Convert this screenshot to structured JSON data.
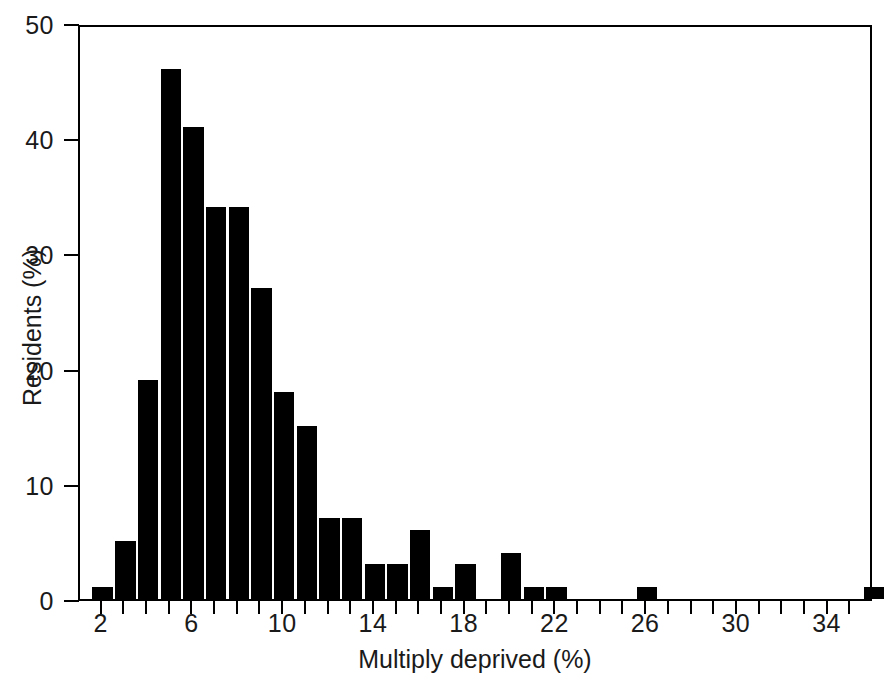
{
  "chart_data": {
    "type": "bar",
    "title": "",
    "subtitle": "",
    "xlabel": "Multiply deprived (%)",
    "ylabel": "Residents (%)",
    "xlim": [
      1,
      36
    ],
    "ylim": [
      0,
      50
    ],
    "grid": false,
    "legend": null,
    "bar_color": "#000000",
    "axis_color": "#000000",
    "bin_width": 1,
    "x_tick_labels": [
      "2",
      "6",
      "10",
      "14",
      "18",
      "22",
      "26",
      "30",
      "34"
    ],
    "x_tick_values": [
      2,
      6,
      10,
      14,
      18,
      22,
      26,
      30,
      34
    ],
    "x_minor_tick_values": [
      1,
      2,
      3,
      4,
      5,
      6,
      7,
      8,
      9,
      10,
      11,
      12,
      13,
      14,
      15,
      16,
      17,
      18,
      19,
      20,
      21,
      22,
      23,
      24,
      25,
      26,
      27,
      28,
      29,
      30,
      31,
      32,
      33,
      34,
      35,
      36
    ],
    "y_tick_labels": [
      "0",
      "10",
      "20",
      "30",
      "40",
      "50"
    ],
    "y_tick_values": [
      0,
      10,
      20,
      30,
      40,
      50
    ],
    "categories": [
      2,
      3,
      4,
      5,
      6,
      7,
      8,
      9,
      10,
      11,
      12,
      13,
      14,
      15,
      16,
      17,
      18,
      19,
      20,
      21,
      22,
      23,
      24,
      25,
      26,
      27,
      28,
      29,
      30,
      31,
      32,
      33,
      34,
      35,
      36
    ],
    "values": [
      1,
      5,
      19,
      46,
      41,
      34,
      34,
      27,
      18,
      15,
      7,
      7,
      3,
      3,
      6,
      1,
      3,
      0,
      4,
      1,
      1,
      0,
      0,
      0,
      1,
      0,
      0,
      0,
      0,
      0,
      0,
      0,
      0,
      0,
      1
    ],
    "annotations": []
  }
}
